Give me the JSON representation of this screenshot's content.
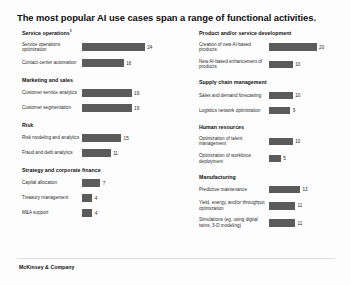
{
  "title": "The most popular AI use cases span a range of functional activities.",
  "footer": "McKinsey & Company",
  "scale_max": 26,
  "bar_color": "#5b5b5b",
  "chart_data": {
    "type": "bar",
    "title": "The most popular AI use cases span a range of functional activities.",
    "xlabel": "",
    "ylabel": "",
    "orientation": "horizontal",
    "xlim": [
      0,
      26
    ],
    "grid": false,
    "legend": null,
    "note": "Values are percentages of respondents reporting adoption of each AI use case.",
    "groups": [
      {
        "name": "Service operations",
        "footnote": "1",
        "column": "left",
        "categories": [
          "Service operations optimization",
          "Contact-center automation"
        ],
        "values": [
          24,
          16
        ]
      },
      {
        "name": "Product and/or service development",
        "footnote": "",
        "column": "right",
        "categories": [
          "Creation of new AI-based products",
          "New AI-based enhancement of products"
        ],
        "values": [
          20,
          10
        ]
      },
      {
        "name": "Marketing and sales",
        "footnote": "",
        "column": "left",
        "categories": [
          "Customer service analytics",
          "Customer segmentation"
        ],
        "values": [
          19,
          19
        ]
      },
      {
        "name": "Supply chain management",
        "footnote": "",
        "column": "right",
        "categories": [
          "Sales and demand forecasting",
          "Logistics network optimization"
        ],
        "values": [
          10,
          9
        ]
      },
      {
        "name": "Risk",
        "footnote": "",
        "column": "left",
        "categories": [
          "Risk modeling and analytics",
          "Fraud and debt analytics"
        ],
        "values": [
          15,
          11
        ]
      },
      {
        "name": "Human resources",
        "footnote": "",
        "column": "right",
        "categories": [
          "Optimization of talent management",
          "Optimization of workforce deployment"
        ],
        "values": [
          10,
          5
        ]
      },
      {
        "name": "Strategy and corporate finance",
        "footnote": "",
        "column": "left",
        "categories": [
          "Capital allocation",
          "Treasury management",
          "M&A support"
        ],
        "values": [
          7,
          4,
          4
        ]
      },
      {
        "name": "Manufacturing",
        "footnote": "",
        "column": "right",
        "categories": [
          "Predictive maintenance",
          "Yield, energy, and/or throughput optimization",
          "Simulations (eg, using digital twins, 3-D modeling)"
        ],
        "values": [
          13,
          11,
          11
        ]
      }
    ]
  }
}
